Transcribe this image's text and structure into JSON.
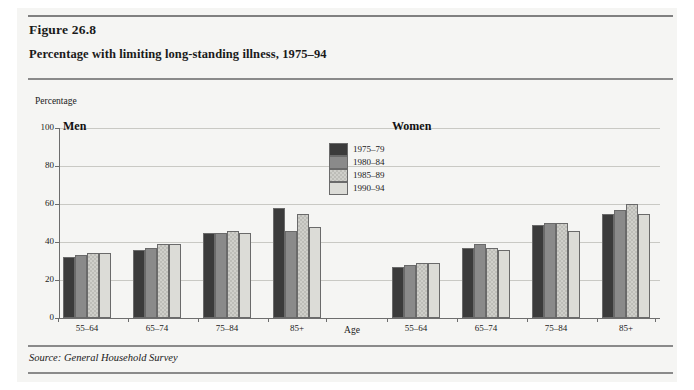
{
  "figure": {
    "number": "Figure 26.8",
    "title": "Percentage with limiting long-standing illness, 1975–94",
    "source": "Source: General Household Survey",
    "y_axis_caption": "Percentage",
    "x_axis_caption": "Age"
  },
  "chart_data": {
    "type": "bar",
    "title": "Percentage with limiting long-standing illness, 1975–94",
    "xlabel": "Age",
    "ylabel": "Percentage",
    "ylim": [
      0,
      100
    ],
    "yticks": [
      0,
      20,
      40,
      60,
      80,
      100
    ],
    "grid": true,
    "legend_position": "center-top",
    "categories": [
      "55–64",
      "65–74",
      "75–84",
      "85+"
    ],
    "panels": [
      {
        "name": "Men",
        "series": [
          {
            "name": "1975–79",
            "values": [
              32,
              36,
              45,
              58
            ]
          },
          {
            "name": "1980–84",
            "values": [
              33,
              37,
              45,
              46
            ]
          },
          {
            "name": "1985–89",
            "values": [
              34,
              39,
              46,
              55
            ]
          },
          {
            "name": "1990–94",
            "values": [
              34,
              39,
              45,
              48
            ]
          }
        ]
      },
      {
        "name": "Women",
        "series": [
          {
            "name": "1975–79",
            "values": [
              27,
              37,
              49,
              55
            ]
          },
          {
            "name": "1980–84",
            "values": [
              28,
              39,
              50,
              57
            ]
          },
          {
            "name": "1985–89",
            "values": [
              29,
              37,
              50,
              60
            ]
          },
          {
            "name": "1990–94",
            "values": [
              29,
              36,
              46,
              55
            ]
          }
        ]
      }
    ],
    "legend": [
      {
        "label": "1975–79",
        "color": "#3b3b3b"
      },
      {
        "label": "1980–84",
        "color": "#8a8a8a"
      },
      {
        "label": "1985–89",
        "color": "#cfcfca"
      },
      {
        "label": "1990–94",
        "color": "#dcdcd7"
      }
    ]
  }
}
